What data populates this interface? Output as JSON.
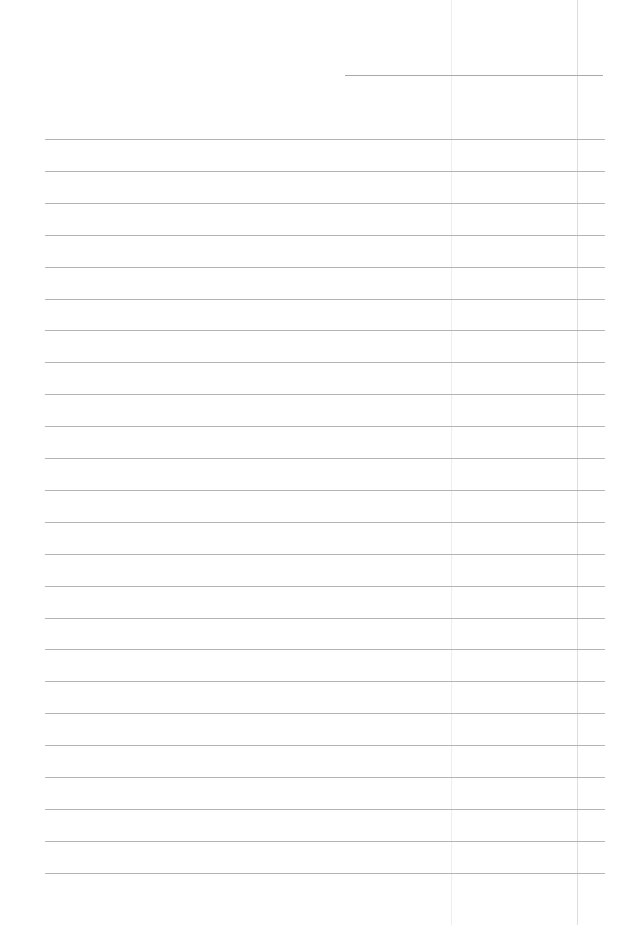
{
  "page": {
    "type": "lined-paper",
    "background": "#ffffff",
    "line_color": "#b4b4b4",
    "header_line": {
      "x1": 345,
      "x2": 603,
      "y": 75
    },
    "ruled_lines": {
      "x1": 45,
      "x2": 605,
      "first_y": 139,
      "spacing": 31.9,
      "count": 24
    },
    "margin_lines": [
      {
        "x": 451,
        "color": "#eeeeee"
      },
      {
        "x": 577,
        "color": "#dddddd"
      }
    ]
  }
}
